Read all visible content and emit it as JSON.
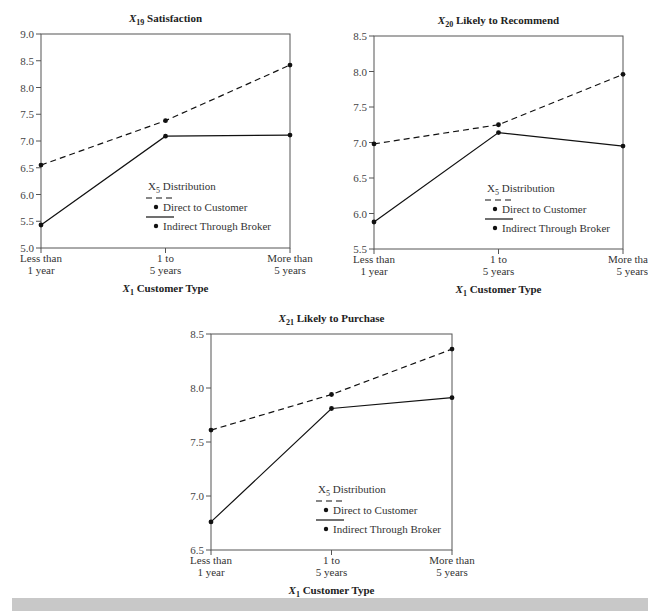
{
  "chart_data": [
    {
      "type": "line",
      "title": "X19 Satisfaction",
      "title_main": "X",
      "title_sub": "19",
      "title_rest": " Satisfaction",
      "xlabel": "X1 Customer Type",
      "categories": [
        "Less than 1 year",
        "1 to 5 years",
        "More than 5 years"
      ],
      "ylim": [
        5.0,
        9.0
      ],
      "yticks": [
        "5.0",
        "5.5",
        "6.0",
        "6.5",
        "7.0",
        "7.5",
        "8.0",
        "8.5",
        "9.0"
      ],
      "legend_title": "X5 Distribution",
      "series": [
        {
          "name": "Direct to Customer",
          "style": "dashed",
          "values": [
            6.55,
            7.38,
            8.42
          ]
        },
        {
          "name": "Indirect Through Broker",
          "style": "solid",
          "values": [
            5.43,
            7.09,
            7.11
          ]
        }
      ]
    },
    {
      "type": "line",
      "title": "X20 Likely to Recommend",
      "title_main": "X",
      "title_sub": "20",
      "title_rest": " Likely to Recommend",
      "xlabel": "X1 Customer Type",
      "categories": [
        "Less than 1 year",
        "1 to 5 years",
        "More tha 5 years"
      ],
      "ylim": [
        5.5,
        8.5
      ],
      "yticks": [
        "5.5",
        "6.0",
        "6.5",
        "7.0",
        "7.5",
        "8.0",
        "8.5"
      ],
      "legend_title": "X5 Distribution",
      "series": [
        {
          "name": "Direct to Customer",
          "style": "dashed",
          "values": [
            6.98,
            7.25,
            7.96
          ]
        },
        {
          "name": "Indirect Through Broker",
          "style": "solid",
          "values": [
            5.88,
            7.14,
            6.95
          ]
        }
      ]
    },
    {
      "type": "line",
      "title": "X21 Likely to Purchase",
      "title_main": "X",
      "title_sub": "21",
      "title_rest": " Likely to Purchase",
      "xlabel": "X1 Customer Type",
      "categories": [
        "Less than 1 year",
        "1 to 5 years",
        "More than 5 years"
      ],
      "ylim": [
        6.5,
        8.5
      ],
      "yticks": [
        "6.5",
        "7.0",
        "7.5",
        "8.0",
        "8.5"
      ],
      "legend_title": "X5 Distribution",
      "series": [
        {
          "name": "Direct to Customer",
          "style": "dashed",
          "values": [
            7.61,
            7.94,
            8.36
          ]
        },
        {
          "name": "Indirect Through Broker",
          "style": "solid",
          "values": [
            6.76,
            7.81,
            7.91
          ]
        }
      ]
    }
  ],
  "labels": {
    "xaxis_main": "X",
    "xaxis_sub": "1",
    "xaxis_rest": " Customer Type",
    "legend_x": "X",
    "legend_sub": "5",
    "legend_rest": " Distribution",
    "series1": "Direct to Customer",
    "series2": "Indirect Through Broker"
  }
}
